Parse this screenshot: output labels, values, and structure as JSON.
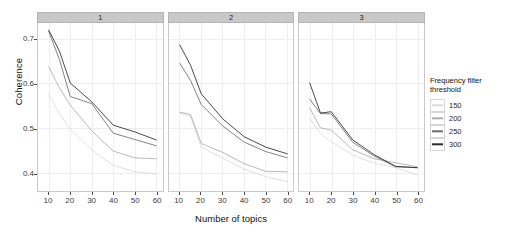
{
  "chart_data": {
    "type": "line",
    "title": "",
    "xlabel": "Number of topics",
    "ylabel": "Coherence",
    "xlim": [
      5,
      63
    ],
    "ylim": [
      0.36,
      0.735
    ],
    "xticks": [
      10,
      20,
      30,
      40,
      50,
      60
    ],
    "yticks": [
      0.7,
      0.6,
      0.5,
      0.4
    ],
    "ytick_labels": [
      "0.7",
      "0.6",
      "0.5",
      "0.4"
    ],
    "grid": true,
    "legend_position": "right",
    "legend_title": "Frequency filter threshold",
    "facet_labels": [
      "1",
      "2",
      "3"
    ],
    "x": [
      10,
      15,
      20,
      30,
      40,
      50,
      60
    ],
    "series_names": [
      "150",
      "200",
      "250",
      "300"
    ],
    "series_colors": [
      "#d9d9d9",
      "#aeaeae",
      "#6e6e6e",
      "#2b2b2b"
    ],
    "panels": [
      {
        "label": "1",
        "series": [
          {
            "name": "150",
            "values": [
              0.575,
              0.532,
              0.498,
              0.452,
              0.417,
              0.403,
              0.398
            ]
          },
          {
            "name": "200",
            "values": [
              0.637,
              0.59,
              0.552,
              0.494,
              0.449,
              0.434,
              0.432
            ]
          },
          {
            "name": "250",
            "values": [
              0.716,
              0.653,
              0.571,
              0.555,
              0.489,
              0.475,
              0.461
            ]
          },
          {
            "name": "300",
            "values": [
              0.719,
              0.672,
              0.601,
              0.559,
              0.507,
              0.492,
              0.474
            ]
          }
        ]
      },
      {
        "label": "2",
        "series": [
          {
            "name": "150",
            "values": [
              0.533,
              0.527,
              0.458,
              0.433,
              0.409,
              0.392,
              0.381
            ]
          },
          {
            "name": "200",
            "values": [
              0.536,
              0.531,
              0.466,
              0.446,
              0.421,
              0.404,
              0.403
            ]
          },
          {
            "name": "250",
            "values": [
              0.645,
              0.607,
              0.553,
              0.505,
              0.469,
              0.448,
              0.434
            ]
          },
          {
            "name": "300",
            "values": [
              0.686,
              0.641,
              0.577,
              0.521,
              0.481,
              0.458,
              0.443
            ]
          }
        ]
      },
      {
        "label": "3",
        "series": [
          {
            "name": "150",
            "values": [
              0.522,
              0.488,
              0.47,
              0.44,
              0.422,
              0.412,
              0.396
            ]
          },
          {
            "name": "200",
            "values": [
              0.545,
              0.501,
              0.496,
              0.452,
              0.432,
              0.423,
              0.414
            ]
          },
          {
            "name": "250",
            "values": [
              0.565,
              0.533,
              0.532,
              0.469,
              0.438,
              0.414,
              0.412
            ]
          },
          {
            "name": "300",
            "values": [
              0.601,
              0.534,
              0.537,
              0.474,
              0.441,
              0.415,
              0.412
            ]
          }
        ]
      }
    ]
  },
  "legend": {
    "title_line1": "Frequency filter",
    "title_line2": "threshold",
    "items": [
      {
        "label": "150",
        "color": "#d9d9d9"
      },
      {
        "label": "200",
        "color": "#aeaeae"
      },
      {
        "label": "250",
        "color": "#6e6e6e"
      },
      {
        "label": "300",
        "color": "#2b2b2b"
      }
    ]
  },
  "axes": {
    "y_title": "Coherence",
    "x_title": "Number of topics"
  }
}
